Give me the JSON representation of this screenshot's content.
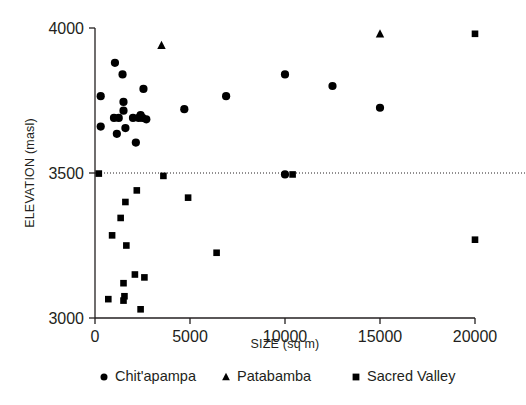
{
  "chart_data": {
    "type": "scatter",
    "title": "",
    "xlabel": "SIZE (sq m)",
    "ylabel": "ELEVATION (masl)",
    "xlim": [
      0,
      20000
    ],
    "ylim": [
      3000,
      4000
    ],
    "xticks": [
      0,
      5000,
      10000,
      15000,
      20000
    ],
    "xtick_labels": [
      "0",
      "5000",
      "10000",
      "15000",
      "20000"
    ],
    "yticks": [
      3000,
      3500,
      4000
    ],
    "ytick_labels": [
      "3000",
      "3500",
      "4000"
    ],
    "grid": false,
    "reference_line": {
      "orientation": "horizontal",
      "y": 3500,
      "style": "dotted"
    },
    "legend_position": "bottom",
    "series": [
      {
        "name": "Chit'apampa",
        "marker": "circle",
        "color": "#000000",
        "points": [
          [
            300,
            3765
          ],
          [
            300,
            3660
          ],
          [
            1050,
            3880
          ],
          [
            1450,
            3840
          ],
          [
            1500,
            3745
          ],
          [
            1500,
            3715
          ],
          [
            1600,
            3655
          ],
          [
            1000,
            3690
          ],
          [
            1250,
            3690
          ],
          [
            1150,
            3635
          ],
          [
            2000,
            3690
          ],
          [
            2300,
            3690
          ],
          [
            2400,
            3700
          ],
          [
            2500,
            3690
          ],
          [
            2700,
            3685
          ],
          [
            2150,
            3605
          ],
          [
            2550,
            3790
          ],
          [
            4700,
            3720
          ],
          [
            6900,
            3765
          ],
          [
            10000,
            3840
          ],
          [
            12500,
            3800
          ],
          [
            15000,
            3725
          ],
          [
            10000,
            3495
          ]
        ]
      },
      {
        "name": "Patabamba",
        "marker": "triangle",
        "color": "#000000",
        "points": [
          [
            3500,
            3940
          ],
          [
            15000,
            3980
          ]
        ]
      },
      {
        "name": "Sacred Valley",
        "marker": "square",
        "color": "#000000",
        "points": [
          [
            200,
            3498
          ],
          [
            3600,
            3490
          ],
          [
            2200,
            3440
          ],
          [
            1600,
            3400
          ],
          [
            4900,
            3415
          ],
          [
            1350,
            3345
          ],
          [
            900,
            3285
          ],
          [
            1650,
            3250
          ],
          [
            6400,
            3225
          ],
          [
            2100,
            3150
          ],
          [
            1500,
            3120
          ],
          [
            2600,
            3140
          ],
          [
            700,
            3065
          ],
          [
            1500,
            3060
          ],
          [
            1550,
            3075
          ],
          [
            2400,
            3030
          ],
          [
            10400,
            3495
          ],
          [
            20000,
            3980
          ],
          [
            20000,
            3270
          ]
        ]
      }
    ]
  },
  "legend": {
    "items": [
      {
        "label": "Chit'apampa",
        "marker": "circle"
      },
      {
        "label": "Patabamba",
        "marker": "triangle"
      },
      {
        "label": "Sacred Valley",
        "marker": "square"
      }
    ]
  }
}
